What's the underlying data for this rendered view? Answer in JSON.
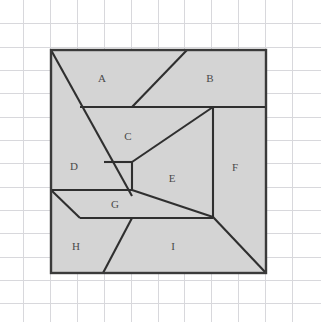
{
  "figure": {
    "canvas": {
      "width": 321,
      "height": 322,
      "background": "#ffffff"
    },
    "grid": {
      "visible": true,
      "color": "#d8d8dc",
      "x_positions": [
        23,
        50,
        77,
        104,
        131,
        158,
        184,
        211,
        238,
        265,
        292
      ],
      "y_positions": [
        23,
        47,
        70,
        93,
        117,
        140,
        163,
        187,
        210,
        233,
        257,
        280,
        303
      ]
    },
    "square": {
      "name": "outer-square",
      "fill": "#d4d4d4",
      "stroke": "#3a3a3a",
      "left": 51,
      "top": 50,
      "right": 266,
      "bottom": 273
    },
    "regions": [
      {
        "id": "A",
        "label": "A",
        "label_x": 102,
        "label_y": 79
      },
      {
        "id": "B",
        "label": "B",
        "label_x": 210,
        "label_y": 79
      },
      {
        "id": "C",
        "label": "C",
        "label_x": 128,
        "label_y": 137
      },
      {
        "id": "D",
        "label": "D",
        "label_x": 74,
        "label_y": 167
      },
      {
        "id": "E",
        "label": "E",
        "label_x": 172,
        "label_y": 179
      },
      {
        "id": "F",
        "label": "F",
        "label_x": 235,
        "label_y": 168
      },
      {
        "id": "G",
        "label": "G",
        "label_x": 115,
        "label_y": 205
      },
      {
        "id": "H",
        "label": "H",
        "label_x": 76,
        "label_y": 247
      },
      {
        "id": "I",
        "label": "I",
        "label_x": 173,
        "label_y": 247
      }
    ],
    "dividers": [
      {
        "name": "divider-a-left-diagonal",
        "points": "51,50 132,196"
      },
      {
        "name": "divider-a-b-diagonal",
        "points": "187,50 132,107"
      },
      {
        "name": "divider-top-horizontal",
        "points": "80,107 266,107"
      },
      {
        "name": "divider-c-e-diagonal",
        "points": "213,107 132,162"
      },
      {
        "name": "divider-d-c-horizontal",
        "points": "104,162 132,162"
      },
      {
        "name": "divider-de-vertical",
        "points": "132,162 132,190"
      },
      {
        "name": "divider-f-vertical",
        "points": "213,107 213,217"
      },
      {
        "name": "divider-g-top-horizontal",
        "points": "51,190 132,190"
      },
      {
        "name": "divider-g-e-diagonal",
        "points": "132,190 213,217"
      },
      {
        "name": "divider-g-left-diagonal",
        "points": "51,190 80,218"
      },
      {
        "name": "divider-g-bottom-horizontal",
        "points": "80,218 213,218"
      },
      {
        "name": "divider-h-i-diagonal",
        "points": "132,218 103,273"
      },
      {
        "name": "divider-i-f-diagonal",
        "points": "213,217 266,273"
      }
    ]
  }
}
